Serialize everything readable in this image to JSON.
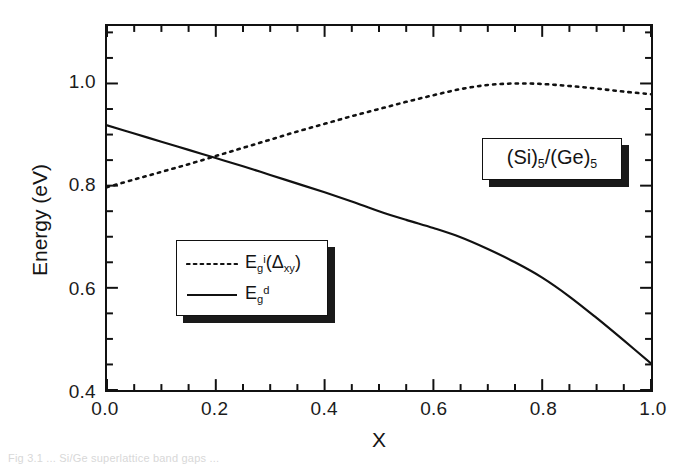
{
  "figure": {
    "caption": "Fig 3.1 ... Si/Ge superlattice band gaps ..."
  },
  "axes": {
    "x_title": "X",
    "y_title": "Energy (eV)",
    "x_ticks": [
      "0.0",
      "0.2",
      "0.4",
      "0.6",
      "0.8",
      "1.0"
    ],
    "y_ticks": [
      "0.4",
      "0.6",
      "0.8",
      "1.0"
    ]
  },
  "legend": {
    "entries": [
      {
        "style": "dotted",
        "symbol": "E",
        "sub": "g",
        "sup": "i",
        "tail": "(Δ",
        "tail_sub": "xy",
        "tail_end": ")"
      },
      {
        "style": "solid",
        "symbol": "E",
        "sub": "g",
        "sup": "d",
        "tail": "",
        "tail_sub": "",
        "tail_end": ""
      }
    ],
    "entry_0_label": "E g i (Δ xy )",
    "entry_1_label": "E g d"
  },
  "annotation": {
    "prefix": "(Si)",
    "sub1": "5",
    "middle": "/(Ge)",
    "sub2": "5"
  },
  "chart_data": {
    "type": "line",
    "title": "",
    "xlabel": "X",
    "ylabel": "Energy (eV)",
    "xlim": [
      0.0,
      1.0
    ],
    "ylim": [
      0.4,
      1.1125
    ],
    "grid": false,
    "legend_position": "inside-lower-left",
    "x_major_tick_step": 0.2,
    "x_minor_tick_step": 0.05,
    "y_major_tick_step": 0.2,
    "y_minor_tick_step": 0.05,
    "tick_direction": "in",
    "series": [
      {
        "name": "E_g^i(Delta_xy)",
        "style": "dotted",
        "x": [
          0.0,
          0.05,
          0.1,
          0.15,
          0.2,
          0.25,
          0.3,
          0.35,
          0.4,
          0.45,
          0.5,
          0.55,
          0.6,
          0.65,
          0.7,
          0.75,
          0.8,
          0.85,
          0.9,
          0.95,
          1.0
        ],
        "values": [
          0.797,
          0.812,
          0.827,
          0.842,
          0.858,
          0.874,
          0.89,
          0.906,
          0.921,
          0.936,
          0.95,
          0.964,
          0.977,
          0.989,
          0.997,
          1.0,
          0.999,
          0.995,
          0.99,
          0.984,
          0.979
        ]
      },
      {
        "name": "E_g^d",
        "style": "solid",
        "x": [
          0.0,
          0.05,
          0.1,
          0.15,
          0.2,
          0.25,
          0.3,
          0.35,
          0.4,
          0.45,
          0.5,
          0.55,
          0.6,
          0.65,
          0.7,
          0.75,
          0.8,
          0.85,
          0.9,
          0.95,
          1.0
        ],
        "values": [
          0.918,
          0.902,
          0.886,
          0.87,
          0.854,
          0.838,
          0.821,
          0.804,
          0.787,
          0.769,
          0.75,
          0.733,
          0.717,
          0.699,
          0.676,
          0.65,
          0.62,
          0.583,
          0.541,
          0.497,
          0.452
        ]
      }
    ],
    "annotations": [
      {
        "text": "(Si)5/(Ge)5",
        "x": 0.77,
        "y": 0.7
      }
    ]
  }
}
